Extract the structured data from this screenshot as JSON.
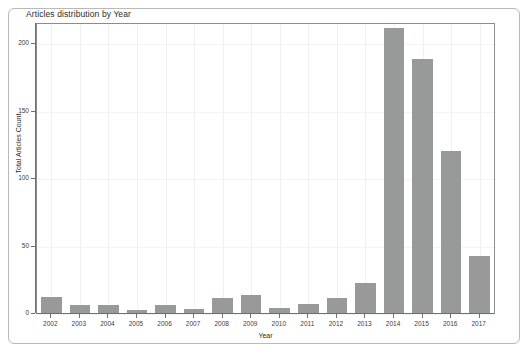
{
  "chart_data": {
    "type": "bar",
    "title": "Articles distribution by Year",
    "xlabel": "Year",
    "ylabel": "Total Articles Count",
    "categories": [
      "2002",
      "2003",
      "2004",
      "2005",
      "2006",
      "2007",
      "2008",
      "2009",
      "2010",
      "2011",
      "2012",
      "2013",
      "2014",
      "2015",
      "2016",
      "2017"
    ],
    "values": [
      12,
      6,
      6,
      2,
      6,
      3,
      11,
      13,
      4,
      7,
      11,
      22,
      211,
      188,
      120,
      42
    ],
    "ylim": [
      0,
      215
    ],
    "yticks": [
      0,
      50,
      100,
      150,
      200
    ],
    "ytick_labels": [
      "0",
      "50",
      "100",
      "150",
      "200"
    ],
    "grid": true,
    "legend": "none",
    "bar_color": "#989999",
    "axis_color": "#6f6f6f",
    "panel_border_color": "#8c8c8c",
    "frame_border_color": "#b9b9b9",
    "background": "#ffffff"
  }
}
